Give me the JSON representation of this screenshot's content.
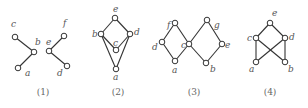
{
  "diagrams": [
    {
      "caption": "(1)",
      "caption_pos": [
        43,
        95
      ],
      "nodes": [
        {
          "id": "c",
          "x": 15,
          "y": 37,
          "lx": 11,
          "ly": 27
        },
        {
          "id": "b",
          "x": 34,
          "y": 52,
          "lx": 35,
          "ly": 45
        },
        {
          "id": "a",
          "x": 18,
          "y": 68,
          "lx": 25,
          "ly": 76
        },
        {
          "id": "f",
          "x": 64,
          "y": 36,
          "lx": 63,
          "ly": 26
        },
        {
          "id": "e",
          "x": 49,
          "y": 51,
          "lx": 46,
          "ly": 45
        },
        {
          "id": "d",
          "x": 67,
          "y": 66,
          "lx": 57,
          "ly": 76
        }
      ],
      "edges": [
        [
          "c",
          "b"
        ],
        [
          "b",
          "a"
        ],
        [
          "f",
          "e"
        ],
        [
          "e",
          "d"
        ]
      ]
    },
    {
      "caption": "(2)",
      "caption_pos": [
        118,
        95
      ],
      "nodes": [
        {
          "id": "e",
          "x": 115,
          "y": 18,
          "lx": 113,
          "ly": 12
        },
        {
          "id": "b",
          "x": 101,
          "y": 34,
          "lx": 92,
          "ly": 37
        },
        {
          "id": "d",
          "x": 130,
          "y": 34,
          "lx": 134,
          "ly": 35
        },
        {
          "id": "c",
          "x": 116,
          "y": 50,
          "lx": 113,
          "ly": 46
        },
        {
          "id": "a",
          "x": 116,
          "y": 69,
          "lx": 113,
          "ly": 80
        }
      ],
      "edges": [
        [
          "e",
          "b"
        ],
        [
          "e",
          "d"
        ],
        [
          "b",
          "c"
        ],
        [
          "d",
          "c"
        ],
        [
          "b",
          "a"
        ],
        [
          "d",
          "a"
        ]
      ]
    },
    {
      "caption": "(3)",
      "caption_pos": [
        194,
        95
      ],
      "nodes": [
        {
          "id": "f",
          "x": 175,
          "y": 23,
          "lx": 167,
          "ly": 28
        },
        {
          "id": "d",
          "x": 162,
          "y": 42,
          "lx": 152,
          "ly": 50
        },
        {
          "id": "c",
          "x": 189,
          "y": 44,
          "lx": 181,
          "ly": 48
        },
        {
          "id": "a",
          "x": 175,
          "y": 61,
          "lx": 172,
          "ly": 73
        },
        {
          "id": "g",
          "x": 207,
          "y": 20,
          "lx": 214,
          "ly": 28
        },
        {
          "id": "e",
          "x": 222,
          "y": 44,
          "lx": 225,
          "ly": 48
        },
        {
          "id": "b",
          "x": 206,
          "y": 63,
          "lx": 210,
          "ly": 72
        }
      ],
      "edges": [
        [
          "f",
          "d"
        ],
        [
          "f",
          "c"
        ],
        [
          "d",
          "a"
        ],
        [
          "c",
          "a"
        ],
        [
          "g",
          "c"
        ],
        [
          "g",
          "e"
        ],
        [
          "c",
          "b"
        ],
        [
          "e",
          "b"
        ]
      ]
    },
    {
      "caption": "(4)",
      "caption_pos": [
        270,
        95
      ],
      "nodes": [
        {
          "id": "e",
          "x": 270,
          "y": 23,
          "lx": 272,
          "ly": 16
        },
        {
          "id": "c",
          "x": 256,
          "y": 38,
          "lx": 247,
          "ly": 41
        },
        {
          "id": "d",
          "x": 285,
          "y": 38,
          "lx": 289,
          "ly": 40
        },
        {
          "id": "a",
          "x": 256,
          "y": 62,
          "lx": 249,
          "ly": 72
        },
        {
          "id": "b",
          "x": 285,
          "y": 62,
          "lx": 288,
          "ly": 72
        }
      ],
      "edges": [
        [
          "e",
          "c"
        ],
        [
          "e",
          "d"
        ],
        [
          "c",
          "a"
        ],
        [
          "d",
          "b"
        ],
        [
          "c",
          "b"
        ],
        [
          "d",
          "a"
        ]
      ]
    }
  ]
}
